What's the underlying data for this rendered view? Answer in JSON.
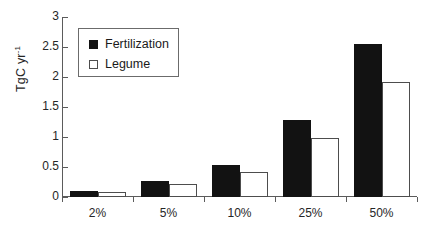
{
  "chart_data": {
    "type": "bar",
    "title": "",
    "subtitle": "",
    "xlabel": "",
    "ylabel": "TgC yr",
    "ylabel_sup": "-1",
    "categories": [
      "2%",
      "5%",
      "10%",
      "25%",
      "50%"
    ],
    "series": [
      {
        "name": "Fertilization",
        "color": "#121212",
        "fill": "solid",
        "values": [
          0.1,
          0.26,
          0.53,
          1.28,
          2.55
        ]
      },
      {
        "name": "Legume",
        "color": "#ffffff",
        "fill": "open",
        "values": [
          0.08,
          0.21,
          0.41,
          0.98,
          1.92
        ]
      }
    ],
    "ylim": [
      0,
      3
    ],
    "yticks": [
      0,
      0.5,
      1,
      1.5,
      2,
      2.5,
      3
    ],
    "ytick_labels": [
      "0",
      "0.5",
      "1",
      "1.5",
      "2",
      "2.5",
      "3"
    ],
    "grid": false,
    "legend_position": "top-left"
  },
  "legend": {
    "items": [
      {
        "label": "Fertilization",
        "swatch": "filled-square-icon"
      },
      {
        "label": "Legume",
        "swatch": "open-square-icon"
      }
    ]
  }
}
